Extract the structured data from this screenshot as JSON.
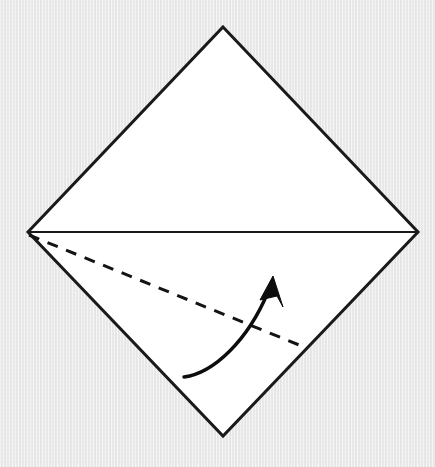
{
  "figure": {
    "kind": "origami-fold-diagram",
    "canvas": {
      "width": 435,
      "height": 467
    },
    "colors": {
      "background": "#e9e9e9",
      "paper_fill": "#ffffff",
      "outline": "#1a1a1a",
      "fold_line": "#1a1a1a",
      "crease_dashed": "#141414",
      "arrow": "#0d0d0d"
    },
    "paper_sheet": {
      "shape_name": "square-rotated-45-diamond",
      "points": "223,27 418,232 223,436 28,232",
      "vertices": [
        {
          "name": "top",
          "x": 223,
          "y": 27
        },
        {
          "name": "right",
          "x": 418,
          "y": 232
        },
        {
          "name": "bottom",
          "x": 223,
          "y": 436
        },
        {
          "name": "left",
          "x": 28,
          "y": 232
        }
      ],
      "stroke_width": 3,
      "fill": "#ffffff"
    },
    "horizontal_fold_line": {
      "label": "existing horizontal fold (left vertex to right vertex)",
      "x1": 28,
      "y1": 232,
      "x2": 418,
      "y2": 232,
      "stroke_width": 2.2
    },
    "dashed_crease": {
      "label": "valley fold crease line",
      "x1": 29,
      "y1": 235,
      "x2": 304,
      "y2": 347,
      "stroke_width": 3,
      "dash_length": 11,
      "gap_length": 9
    },
    "curved_arrow": {
      "label": "fold direction arrow (fold lower flap upward)",
      "path": "M 184 377 C 214 373 248 340 268 292",
      "stroke_width": 3.4,
      "tail": {
        "x": 184,
        "y": 377
      },
      "tip": {
        "x": 273,
        "y": 276
      },
      "head_points": "273,276 260,300 277,296 283,307",
      "head_length": 24,
      "head_width": 17
    }
  }
}
